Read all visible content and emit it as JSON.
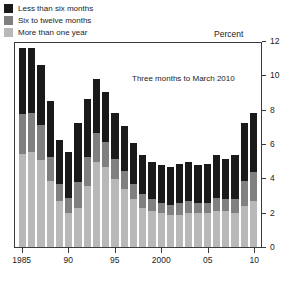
{
  "chart_data": {
    "type": "bar",
    "subtype": "stacked-vertical",
    "title": "",
    "subtitle": "",
    "unit_label": "Percent",
    "xlabel": "",
    "ylabel": "",
    "ylim": [
      0,
      12
    ],
    "yticks": [
      0,
      2,
      4,
      6,
      8,
      10,
      12
    ],
    "ytick_labels": [
      "0",
      "2",
      "4",
      "6",
      "8",
      "10",
      "12"
    ],
    "grid": false,
    "legend_position": "top-left",
    "annotations": [
      {
        "text": "Three months to March 2010",
        "x": 2002.5,
        "y": 10.1
      }
    ],
    "categories": [
      "1985",
      "1986",
      "1987",
      "1988",
      "1989",
      "1990",
      "1991",
      "1992",
      "1993",
      "1994",
      "1995",
      "1996",
      "1997",
      "1998",
      "1999",
      "2000",
      "2001",
      "2002",
      "2003",
      "2004",
      "2005",
      "2006",
      "2007",
      "2008",
      "2009",
      "2010"
    ],
    "xtick_labels": [
      "1985",
      "90",
      "95",
      "2000",
      "05",
      "10"
    ],
    "xtick_categories": [
      "1985",
      "1990",
      "1995",
      "2000",
      "2005",
      "2010"
    ],
    "series": [
      {
        "name": "Less than six months",
        "color": "#1a1a1a",
        "values": [
          3.9,
          3.8,
          3.5,
          3.3,
          2.6,
          2.7,
          3.5,
          3.4,
          3.2,
          2.9,
          2.7,
          2.6,
          2.4,
          2.3,
          2.2,
          2.2,
          2.2,
          2.3,
          2.3,
          2.2,
          2.3,
          2.5,
          2.4,
          2.6,
          3.4,
          3.5
        ]
      },
      {
        "name": "Six to twelve months",
        "color": "#808080",
        "values": [
          2.3,
          2.3,
          2.1,
          1.4,
          1.0,
          0.9,
          1.5,
          1.7,
          1.7,
          1.5,
          1.2,
          1.1,
          0.9,
          0.8,
          0.7,
          0.6,
          0.6,
          0.7,
          0.7,
          0.6,
          0.6,
          0.8,
          0.7,
          0.8,
          1.5,
          1.7
        ]
      },
      {
        "name": "More than one year",
        "color": "#b8b8b8",
        "values": [
          5.5,
          5.6,
          5.1,
          3.9,
          2.7,
          2.0,
          2.3,
          3.6,
          5.0,
          4.7,
          4.0,
          3.4,
          2.8,
          2.3,
          2.1,
          2.0,
          1.9,
          1.9,
          2.0,
          2.0,
          2.0,
          2.1,
          2.1,
          2.0,
          2.4,
          2.7
        ]
      }
    ],
    "totals": [
      11.7,
      11.7,
      10.7,
      8.6,
      6.3,
      5.6,
      7.3,
      8.7,
      9.9,
      9.1,
      7.9,
      7.1,
      6.1,
      5.4,
      5.0,
      4.8,
      4.7,
      4.9,
      5.0,
      4.8,
      4.9,
      5.4,
      5.2,
      5.4,
      7.3,
      7.9
    ]
  },
  "legend": {
    "items": [
      {
        "label": "Less than six months",
        "color": "#1a1a1a"
      },
      {
        "label": "Six to twelve months",
        "color": "#808080"
      },
      {
        "label": "More than one year",
        "color": "#b8b8b8"
      }
    ]
  },
  "colors": {
    "frame": "#3a3a3a",
    "text": "#1c1c1c",
    "background": "#ffffff"
  }
}
